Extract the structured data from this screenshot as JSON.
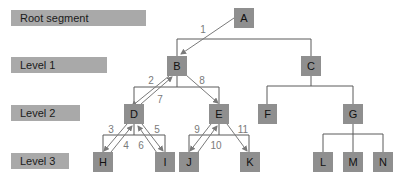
{
  "levels": {
    "root": "Root segment",
    "level1": "Level 1",
    "level2": "Level 2",
    "level3": "Level 3"
  },
  "nodes": {
    "A": "A",
    "B": "B",
    "C": "C",
    "D": "D",
    "E": "E",
    "F": "F",
    "G": "G",
    "H": "H",
    "I": "I",
    "J": "J",
    "K": "K",
    "L": "L",
    "M": "M",
    "N": "N"
  },
  "traversal_steps": [
    "1",
    "2",
    "3",
    "4",
    "5",
    "6",
    "7",
    "8",
    "9",
    "10",
    "11"
  ],
  "colors": {
    "node_fill": "#8f8f8f",
    "level_fill": "#a9a9a9",
    "arrow": "#7a7a7a"
  }
}
